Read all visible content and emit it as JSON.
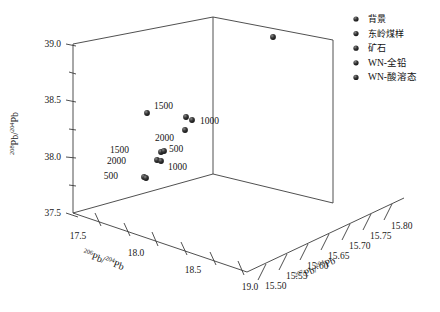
{
  "chart_data": {
    "type": "scatter",
    "projection": "3d",
    "title": "",
    "xlabel": "206Pb/204Pb",
    "ylabel": "208Pb/204Pb",
    "zlabel": "207Pb/204Pb",
    "xlabel_parts": {
      "sup": "206",
      "base": "Pb/",
      "sup2": "204",
      "base2": "Pb"
    },
    "ylabel_parts": {
      "sup": "208",
      "base": "Pb/",
      "sup2": "204",
      "base2": "Pb"
    },
    "zlabel_parts": {
      "sup": "207",
      "base": "Pb/",
      "sup2": "204",
      "base2": "Pb"
    },
    "xlim": [
      17.5,
      19.0
    ],
    "ylim": [
      37.5,
      39.0
    ],
    "zlim": [
      15.5,
      15.8
    ],
    "xticks": [
      "17.5",
      "18.0",
      "18.5",
      "19.0"
    ],
    "yticks": [
      "37.5",
      "38.0",
      "38.5",
      "39.0"
    ],
    "zticks": [
      "15.50",
      "15.55",
      "15.60",
      "15.65",
      "15.70",
      "15.75",
      "15.80"
    ],
    "grid": false,
    "legend_position": "right",
    "marker_color": "#2b2b2b",
    "series": [
      {
        "name": "背景",
        "marker": "sphere",
        "color": "#2b2b2b"
      },
      {
        "name": "东岭煤样",
        "marker": "sphere",
        "color": "#2b2b2b"
      },
      {
        "name": "矿石",
        "marker": "sphere",
        "color": "#2b2b2b"
      },
      {
        "name": "WN-全铅",
        "marker": "sphere",
        "color": "#2b2b2b"
      },
      {
        "name": "WN-酸溶态",
        "marker": "sphere",
        "color": "#2b2b2b"
      }
    ],
    "points": [
      {
        "id": "p1",
        "px": 273,
        "py": 37,
        "label": "",
        "label_dx": 0,
        "label_dy": 0,
        "series": "矿石"
      },
      {
        "id": "p2",
        "px": 147,
        "py": 113,
        "label": "",
        "label_dx": 0,
        "label_dy": 0,
        "series": "背景"
      },
      {
        "id": "p3",
        "px": 186,
        "py": 117,
        "label": "1500",
        "label_dx": -13,
        "label_dy": -8,
        "series": "WN-全铅"
      },
      {
        "id": "p4",
        "px": 192,
        "py": 120,
        "label": "1000",
        "label_dx": 8,
        "label_dy": 4,
        "series": "WN-全铅"
      },
      {
        "id": "p5",
        "px": 185,
        "py": 130,
        "label": "2000",
        "label_dx": -11,
        "label_dy": 11,
        "series": "WN-全铅"
      },
      {
        "id": "p6",
        "px": 161,
        "py": 152,
        "label": "1500",
        "label_dx": -32,
        "label_dy": 1,
        "series": "WN-酸溶态"
      },
      {
        "id": "p7",
        "px": 164,
        "py": 151,
        "label": "500",
        "label_dx": 5,
        "label_dy": 1,
        "series": "WN-酸溶态"
      },
      {
        "id": "p8",
        "px": 157,
        "py": 160,
        "label": "2000",
        "label_dx": -31,
        "label_dy": 4,
        "series": "WN-酸溶态"
      },
      {
        "id": "p9",
        "px": 161,
        "py": 161,
        "label": "1000",
        "label_dx": 7,
        "label_dy": 9,
        "series": "WN-酸溶态"
      },
      {
        "id": "p10",
        "px": 144,
        "py": 177,
        "label": "500",
        "label_dx": -26,
        "label_dy": 2,
        "series": "东岭煤样"
      },
      {
        "id": "p11",
        "px": 146,
        "py": 178,
        "label": "",
        "label_dx": 0,
        "label_dy": 0,
        "series": "东岭煤样"
      }
    ],
    "annotations": [
      "1500",
      "1000",
      "2000",
      "1500",
      "500",
      "2000",
      "1000",
      "500"
    ]
  },
  "legend": {
    "items": [
      {
        "label": "背景"
      },
      {
        "label": "东岭煤样"
      },
      {
        "label": "矿石"
      },
      {
        "label": "WN-全铅"
      },
      {
        "label": "WN-酸溶态"
      }
    ]
  },
  "axes": {
    "y": {
      "ticks": [
        {
          "label": "39.0",
          "x": 48,
          "y": 44
        },
        {
          "label": "38.5",
          "x": 48,
          "y": 100
        },
        {
          "label": "38.0",
          "x": 48,
          "y": 157
        },
        {
          "label": "37.5",
          "x": 48,
          "y": 213
        }
      ]
    },
    "x": {
      "ticks": [
        {
          "label": "17.5",
          "x": 78,
          "y": 234
        },
        {
          "label": "18.0",
          "x": 128,
          "y": 251
        },
        {
          "label": "18.5",
          "x": 178,
          "y": 268
        },
        {
          "label": "19.0",
          "x": 229,
          "y": 285
        }
      ]
    },
    "z": {
      "ticks": [
        {
          "label": "15.50",
          "x": 268,
          "y": 285
        },
        {
          "label": "15.55",
          "x": 288,
          "y": 272
        },
        {
          "label": "15.60",
          "x": 308,
          "y": 259
        },
        {
          "label": "15.65",
          "x": 328,
          "y": 246
        },
        {
          "label": "15.70",
          "x": 348,
          "y": 233
        },
        {
          "label": "15.75",
          "x": 368,
          "y": 220
        },
        {
          "label": "15.80",
          "x": 388,
          "y": 207
        }
      ]
    }
  }
}
